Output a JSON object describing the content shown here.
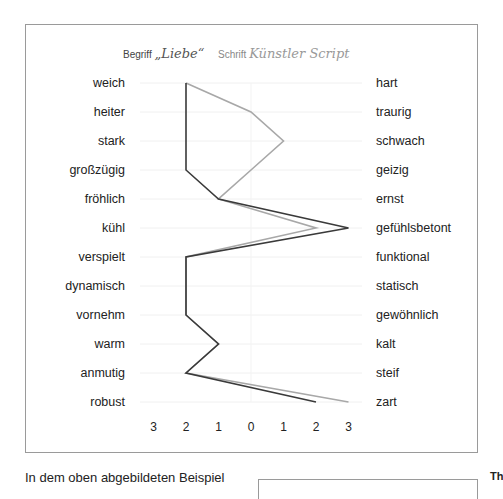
{
  "legend": {
    "term_label": "Begriff",
    "term_value": "„Liebe“",
    "font_label": "Schrift",
    "font_value": "Künstler Script"
  },
  "chart_data": {
    "type": "line",
    "orientation": "horizontal-profile",
    "xlabel": "",
    "ylabel": "",
    "x_ticks": [
      "3",
      "2",
      "1",
      "0",
      "1",
      "2",
      "3"
    ],
    "x_range": [
      -3,
      3
    ],
    "grid": "horizontal",
    "left_poles": [
      "weich",
      "heiter",
      "stark",
      "großzügig",
      "fröhlich",
      "kühl",
      "verspielt",
      "dynamisch",
      "vornehm",
      "warm",
      "anmutig",
      "robust"
    ],
    "right_poles": [
      "hart",
      "traurig",
      "schwach",
      "geizig",
      "ernst",
      "gefühlsbetont",
      "funktional",
      "statisch",
      "gewöhnlich",
      "kalt",
      "steif",
      "zart"
    ],
    "series": [
      {
        "name": "Begriff „Liebe“",
        "color": "#3a3a3a",
        "values": [
          -2,
          -2,
          -2,
          -2,
          -1,
          3,
          -2,
          -2,
          -2,
          -1,
          -2,
          2
        ]
      },
      {
        "name": "Schrift Künstler Script",
        "color": "#a8a8a8",
        "values": [
          -2,
          0,
          1,
          0,
          -1,
          2,
          -2,
          -2,
          -2,
          -1,
          -2,
          3
        ]
      }
    ]
  },
  "text": {
    "caption": "In dem oben abgebildeten Beispiel",
    "side_fragment": "Th"
  }
}
